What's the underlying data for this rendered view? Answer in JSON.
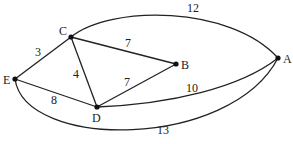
{
  "graph": {
    "nodes": [
      {
        "id": "A",
        "label": "A"
      },
      {
        "id": "B",
        "label": "B"
      },
      {
        "id": "C",
        "label": "C"
      },
      {
        "id": "D",
        "label": "D"
      },
      {
        "id": "E",
        "label": "E"
      }
    ],
    "edges": [
      {
        "from": "E",
        "to": "C",
        "weight": "3"
      },
      {
        "from": "C",
        "to": "B",
        "weight": "7"
      },
      {
        "from": "C",
        "to": "D",
        "weight": "4"
      },
      {
        "from": "E",
        "to": "D",
        "weight": "8"
      },
      {
        "from": "D",
        "to": "B",
        "weight": "7"
      },
      {
        "from": "C",
        "to": "A",
        "weight": "12"
      },
      {
        "from": "D",
        "to": "A",
        "weight": "10"
      },
      {
        "from": "E",
        "to": "A",
        "weight": "13"
      }
    ]
  }
}
